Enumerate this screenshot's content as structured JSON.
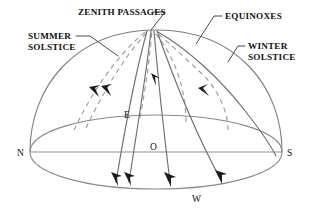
{
  "diagram": {
    "colors": {
      "background": "#ffffff",
      "dome_stroke": "#7c7c7c",
      "solid_path": "#6f6f6f",
      "dashed_path": "#9a9a9a",
      "leader": "#4a4a4a",
      "arrow": "#1c1c1c",
      "text": "#111111"
    },
    "callouts": [
      {
        "id": "zenith-passages",
        "label": "ZENITH PASSAGES",
        "x": 78,
        "y": 7
      },
      {
        "id": "summer-solstice",
        "label": "SUMMER\nSOLSTICE",
        "x": 28,
        "y": 31
      },
      {
        "id": "equinoxes",
        "label": "EQUINOXES",
        "x": 225,
        "y": 11
      },
      {
        "id": "winter-solstice",
        "label": "WINTER\nSOLSTICE",
        "x": 248,
        "y": 41
      }
    ],
    "cardinal_points": [
      {
        "id": "north",
        "label": "N",
        "x": 17,
        "y": 148
      },
      {
        "id": "east",
        "label": "E",
        "x": 124,
        "y": 110
      },
      {
        "id": "origin",
        "label": "O",
        "x": 150,
        "y": 142
      },
      {
        "id": "south",
        "label": "S",
        "x": 287,
        "y": 148
      },
      {
        "id": "west",
        "label": "W",
        "x": 192,
        "y": 194
      }
    ],
    "geometry": {
      "horizon_center_x": 156,
      "horizon_center_y": 152,
      "horizon_radius_x": 126,
      "horizon_radius_y": 37,
      "dome_apex_x": 148,
      "dome_apex_y": 30,
      "axis_start_x": 30,
      "axis_end_x": 282,
      "axis_y": 152
    }
  }
}
